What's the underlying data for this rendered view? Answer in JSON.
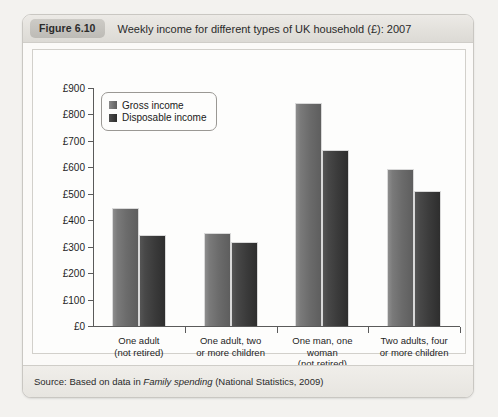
{
  "figure": {
    "badge": "Figure 6.10",
    "title": "Weekly income for different types of UK household (£): 2007",
    "source_prefix": "Source: Based on data in ",
    "source_italic": "Family spending",
    "source_suffix": " (National Statistics, 2009)"
  },
  "chart_data": {
    "type": "bar",
    "title": "Weekly income for different types of UK household (£): 2007",
    "xlabel": "",
    "ylabel": "",
    "ylim": [
      0,
      900
    ],
    "ytick_step": 100,
    "ytick_labels": [
      "£900",
      "£800",
      "£700",
      "£600",
      "£500",
      "£400",
      "£300",
      "£200",
      "£100",
      "£0"
    ],
    "ytick_values": [
      900,
      800,
      700,
      600,
      500,
      400,
      300,
      200,
      100,
      0
    ],
    "grid": false,
    "legend_position": "top-left-inside",
    "categories": [
      "One adult\n(not retired)",
      "One adult, two\nor more children",
      "One man, one\nwoman\n(not retired)",
      "Two adults, four\nor more children"
    ],
    "series": [
      {
        "name": "Gross income",
        "color": "#6b6b6b",
        "values": [
          445,
          352,
          845,
          592
        ]
      },
      {
        "name": "Disposable income",
        "color": "#333333",
        "values": [
          345,
          318,
          665,
          512
        ]
      }
    ]
  }
}
